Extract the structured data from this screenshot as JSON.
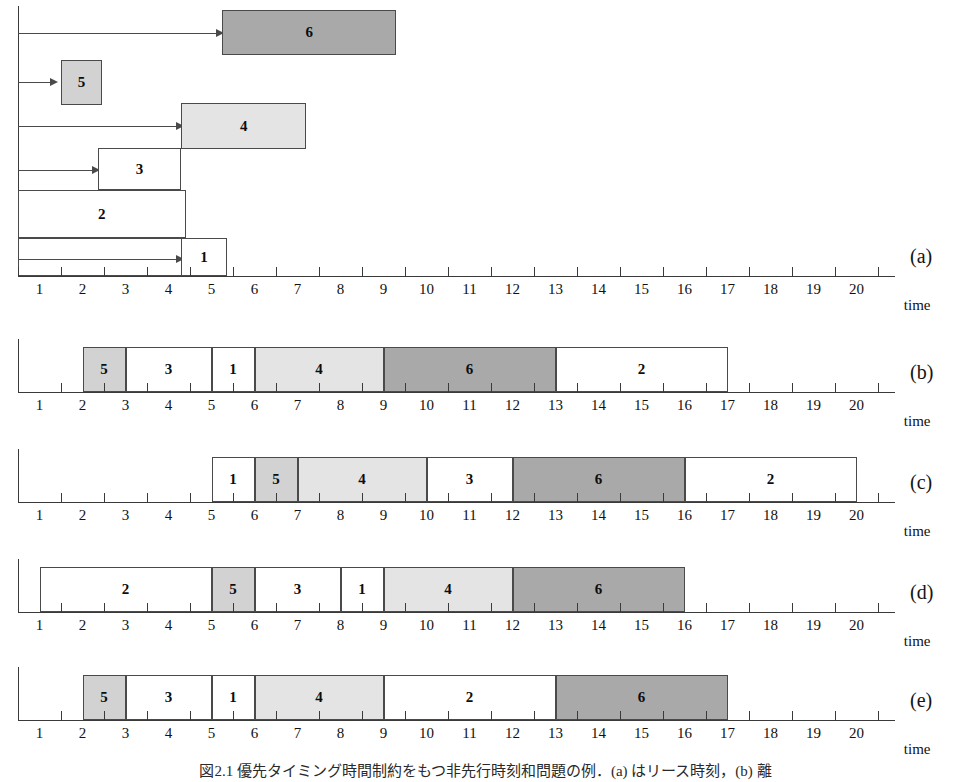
{
  "figure": {
    "time_axis_label": "time",
    "tick_labels": [
      "1",
      "2",
      "3",
      "4",
      "5",
      "6",
      "7",
      "8",
      "9",
      "10",
      "11",
      "12",
      "13",
      "14",
      "15",
      "16",
      "17",
      "18",
      "19",
      "20"
    ],
    "axis_min": 0,
    "axis_max": 20.4,
    "caption": "図2.1  優先タイミング時間制約をもつ非先行時刻和問題の例．(a) はリース時刻，(b) 離"
  },
  "chart_data": {
    "type": "bar",
    "xlabel": "time",
    "ylabel": "",
    "xlim": [
      0,
      20.4
    ],
    "grid": false,
    "legend": "none",
    "task_fills": {
      "1": "white",
      "2": "white",
      "3": "white",
      "4": "light",
      "5": "mid",
      "6": "dark"
    },
    "fill_colors": {
      "white": "#ffffff",
      "light": "#e4e4e4",
      "mid": "#d2d2d2",
      "dark": "#a9a9a9"
    },
    "panels": [
      {
        "letter": "(a)",
        "kind": "release-and-duration",
        "description": "release times with arrows and task duration blocks stacked by index",
        "rows": [
          {
            "task": "6",
            "release": 0,
            "start": 4.75,
            "end": 8.8,
            "fill": "dark"
          },
          {
            "task": "5",
            "release": 0,
            "start": 1.0,
            "end": 1.95,
            "fill": "mid"
          },
          {
            "task": "4",
            "release": 0,
            "start": 3.8,
            "end": 6.7,
            "fill": "light"
          },
          {
            "task": "3",
            "release": 0,
            "start": 1.85,
            "end": 3.8,
            "fill": "white"
          },
          {
            "task": "2",
            "release": 0,
            "start": 0.0,
            "end": 3.9,
            "fill": "white"
          },
          {
            "task": "1",
            "release": 0,
            "start": 3.8,
            "end": 4.85,
            "fill": "white"
          }
        ]
      },
      {
        "letter": "(b)",
        "kind": "schedule",
        "blocks": [
          {
            "task": "5",
            "start": 1.5,
            "end": 2.5,
            "fill": "mid"
          },
          {
            "task": "3",
            "start": 2.5,
            "end": 4.5,
            "fill": "white"
          },
          {
            "task": "1",
            "start": 4.5,
            "end": 5.5,
            "fill": "white"
          },
          {
            "task": "4",
            "start": 5.5,
            "end": 8.5,
            "fill": "light"
          },
          {
            "task": "6",
            "start": 8.5,
            "end": 12.5,
            "fill": "dark"
          },
          {
            "task": "2",
            "start": 12.5,
            "end": 16.5,
            "fill": "white"
          }
        ]
      },
      {
        "letter": "(c)",
        "kind": "schedule",
        "blocks": [
          {
            "task": "1",
            "start": 4.5,
            "end": 5.5,
            "fill": "white"
          },
          {
            "task": "5",
            "start": 5.5,
            "end": 6.5,
            "fill": "mid"
          },
          {
            "task": "4",
            "start": 6.5,
            "end": 9.5,
            "fill": "light"
          },
          {
            "task": "3",
            "start": 9.5,
            "end": 11.5,
            "fill": "white"
          },
          {
            "task": "6",
            "start": 11.5,
            "end": 15.5,
            "fill": "dark"
          },
          {
            "task": "2",
            "start": 15.5,
            "end": 19.5,
            "fill": "white"
          }
        ]
      },
      {
        "letter": "(d)",
        "kind": "schedule",
        "blocks": [
          {
            "task": "2",
            "start": 0.5,
            "end": 4.5,
            "fill": "white"
          },
          {
            "task": "5",
            "start": 4.5,
            "end": 5.5,
            "fill": "mid"
          },
          {
            "task": "3",
            "start": 5.5,
            "end": 7.5,
            "fill": "white"
          },
          {
            "task": "1",
            "start": 7.5,
            "end": 8.5,
            "fill": "white"
          },
          {
            "task": "4",
            "start": 8.5,
            "end": 11.5,
            "fill": "light"
          },
          {
            "task": "6",
            "start": 11.5,
            "end": 15.5,
            "fill": "dark"
          }
        ]
      },
      {
        "letter": "(e)",
        "kind": "schedule",
        "blocks": [
          {
            "task": "5",
            "start": 1.5,
            "end": 2.5,
            "fill": "mid"
          },
          {
            "task": "3",
            "start": 2.5,
            "end": 4.5,
            "fill": "white"
          },
          {
            "task": "1",
            "start": 4.5,
            "end": 5.5,
            "fill": "white"
          },
          {
            "task": "4",
            "start": 5.5,
            "end": 8.5,
            "fill": "light"
          },
          {
            "task": "2",
            "start": 8.5,
            "end": 12.5,
            "fill": "white"
          },
          {
            "task": "6",
            "start": 12.5,
            "end": 16.5,
            "fill": "dark"
          }
        ]
      }
    ]
  },
  "layout": {
    "origin_x": 18,
    "unit_px": 43,
    "panel_tops": [
      0,
      330,
      440,
      550,
      658
    ],
    "axis_y": [
      276,
      392,
      502,
      612,
      720
    ],
    "letter_x": 910,
    "letter_y": [
      246,
      362,
      472,
      582,
      690
    ]
  }
}
